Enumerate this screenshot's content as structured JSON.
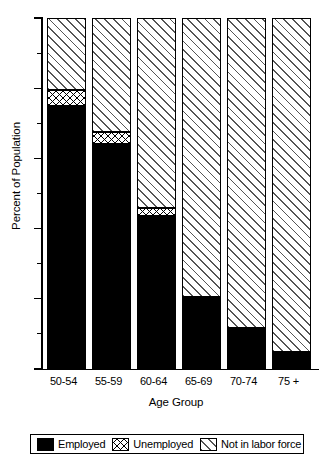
{
  "chart_data": {
    "type": "bar",
    "subtype": "stacked-bar",
    "title": "",
    "xlabel": "Age Group",
    "ylabel": "Percent of Population",
    "categories": [
      "50-54",
      "55-59",
      "60-64",
      "65-69",
      "70-74",
      "75 +"
    ],
    "series": [
      {
        "name": "Employed",
        "values": [
          75.0,
          64.0,
          43.5,
          20.5,
          11.7,
          4.8
        ],
        "fill": "solid-black",
        "color": "#000000"
      },
      {
        "name": "Unemployed",
        "values": [
          4.5,
          3.5,
          2.5,
          0.0,
          0.0,
          0.0
        ],
        "fill": "crosshatch",
        "color": "#000000"
      },
      {
        "name": "Not in labor force",
        "values": [
          20.5,
          32.5,
          54.0,
          79.5,
          88.3,
          95.2
        ],
        "fill": "diagonal-hatch",
        "color": "#555555"
      }
    ],
    "ylim": [
      0,
      100
    ],
    "yticks": [
      0,
      20,
      40,
      60,
      80,
      100
    ],
    "yticks_minor": [
      10,
      30,
      50,
      70,
      90
    ],
    "ytick_labels": [
      "0",
      "20",
      "40",
      "60",
      "80",
      "100"
    ],
    "grid": false,
    "legend_position": "bottom",
    "legend_entries": [
      "Employed",
      "Unemployed",
      "Not in labor force"
    ]
  },
  "legend": {
    "items": [
      {
        "label": "Employed"
      },
      {
        "label": "Unemployed"
      },
      {
        "label": "Not in labor force"
      }
    ]
  }
}
